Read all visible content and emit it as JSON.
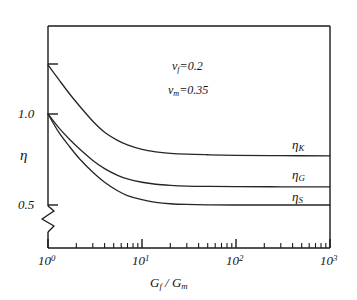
{
  "chart_data": {
    "type": "line",
    "title": "",
    "xlabel": "G_f / G_m",
    "ylabel": "eta",
    "xscale": "log",
    "xlim": [
      1,
      1000
    ],
    "ylim": [
      0.42,
      1.38
    ],
    "grid": false,
    "legend_position": "inline-right",
    "y_axis_break": true,
    "xticks": [
      {
        "value": 1,
        "label": "10",
        "exponent": "0"
      },
      {
        "value": 10,
        "label": "10",
        "exponent": "1"
      },
      {
        "value": 100,
        "label": "10",
        "exponent": "2"
      },
      {
        "value": 1000,
        "label": "10",
        "exponent": "3"
      }
    ],
    "yticks": [
      {
        "value": 1.0,
        "label": "1.0"
      },
      {
        "value": 0.5,
        "label": "0.5"
      },
      {
        "value": 1.27,
        "label": ""
      }
    ],
    "annotations": [
      {
        "symbol": "ν",
        "subscript": "f",
        "relation": "=",
        "value": "0.2"
      },
      {
        "symbol": "ν",
        "subscript": "m",
        "relation": "=",
        "value": "0.35"
      }
    ],
    "series": [
      {
        "name": "eta_K",
        "label_symbol": "η",
        "label_subscript": "K",
        "start_value": 1.27,
        "plateau_value": 0.77,
        "x": [
          1,
          1.3,
          1.7,
          2.2,
          3,
          4,
          5.5,
          7,
          10,
          14,
          20,
          30,
          50,
          100,
          300,
          1000
        ],
        "y": [
          1.27,
          1.19,
          1.11,
          1.04,
          0.96,
          0.9,
          0.855,
          0.83,
          0.805,
          0.792,
          0.784,
          0.779,
          0.776,
          0.773,
          0.771,
          0.77
        ]
      },
      {
        "name": "eta_G",
        "label_symbol": "η",
        "label_subscript": "G",
        "start_value": 1.0,
        "plateau_value": 0.6,
        "x": [
          1,
          1.3,
          1.7,
          2.2,
          3,
          4,
          5.5,
          7,
          10,
          14,
          20,
          30,
          50,
          100,
          300,
          1000
        ],
        "y": [
          1.0,
          0.925,
          0.86,
          0.805,
          0.745,
          0.7,
          0.663,
          0.643,
          0.625,
          0.614,
          0.608,
          0.604,
          0.602,
          0.601,
          0.6,
          0.6
        ]
      },
      {
        "name": "eta_S",
        "label_symbol": "η",
        "label_subscript": "S",
        "start_value": 1.0,
        "plateau_value": 0.5,
        "x": [
          1,
          1.3,
          1.7,
          2.2,
          3,
          4,
          5.5,
          7,
          10,
          14,
          20,
          30,
          50,
          100,
          300,
          1000
        ],
        "y": [
          1.0,
          0.9,
          0.82,
          0.75,
          0.68,
          0.625,
          0.578,
          0.552,
          0.529,
          0.515,
          0.507,
          0.503,
          0.501,
          0.5,
          0.5,
          0.5
        ]
      }
    ]
  },
  "axis": {
    "y_label": "η",
    "x_title_main": "G",
    "x_title_sub1": "f",
    "x_title_slash": " / ",
    "x_title_main2": "G",
    "x_title_sub2": "m"
  },
  "colors": {
    "background": "#ffffff",
    "ink": "#1a1a1a",
    "curve": "#262626"
  }
}
